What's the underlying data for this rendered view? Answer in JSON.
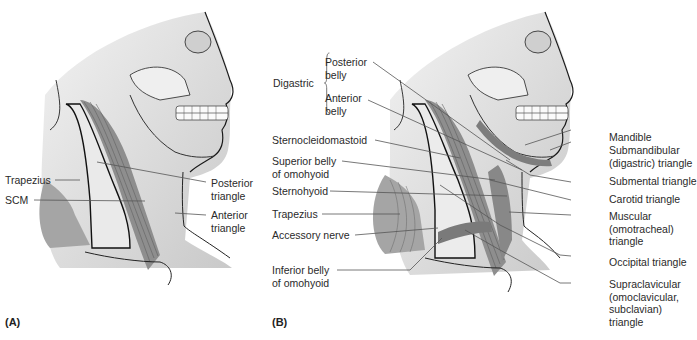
{
  "figure": {
    "panels": [
      {
        "id": "A",
        "label": "(A)",
        "annotations": [
          {
            "text": "Trapezius",
            "side": "left"
          },
          {
            "text": "SCM",
            "side": "left"
          },
          {
            "text": "Posterior triangle",
            "lines": [
              "Posterior",
              "triangle"
            ],
            "side": "right"
          },
          {
            "text": "Anterior triangle",
            "lines": [
              "Anterior",
              "triangle"
            ],
            "side": "right"
          }
        ]
      },
      {
        "id": "B",
        "label": "(B)",
        "digastric": {
          "group_label": "Digastric",
          "parts": [
            {
              "lines": [
                "Posterior",
                "belly"
              ]
            },
            {
              "lines": [
                "Anterior",
                "belly"
              ]
            }
          ]
        },
        "left_annotations": [
          {
            "lines": [
              "Sternocleidomastoid"
            ]
          },
          {
            "lines": [
              "Superior belly",
              "of omohyoid"
            ]
          },
          {
            "lines": [
              "Sternohyoid"
            ]
          },
          {
            "lines": [
              "Trapezius"
            ]
          },
          {
            "lines": [
              "Accessory nerve"
            ]
          },
          {
            "lines": [
              "Inferior belly",
              "of omohyoid"
            ]
          }
        ],
        "right_annotations": [
          {
            "lines": [
              "Mandible"
            ]
          },
          {
            "lines": [
              "Submandibular",
              "(digastric) triangle"
            ]
          },
          {
            "lines": [
              "Submental triangle"
            ]
          },
          {
            "lines": [
              "Carotid triangle"
            ]
          },
          {
            "lines": [
              "Muscular",
              "(omotracheal)",
              "triangle"
            ]
          },
          {
            "lines": [
              "Occipital triangle"
            ]
          },
          {
            "lines": [
              "Supraclavicular",
              "(omoclavicular,",
              "subclavian)",
              "triangle"
            ]
          }
        ]
      }
    ],
    "colors": {
      "background": "#ffffff",
      "skin_shade": "#d9d9d9",
      "muscle": "#9a9a9a",
      "line": "#1a1a1a",
      "leader": "#555555"
    }
  }
}
